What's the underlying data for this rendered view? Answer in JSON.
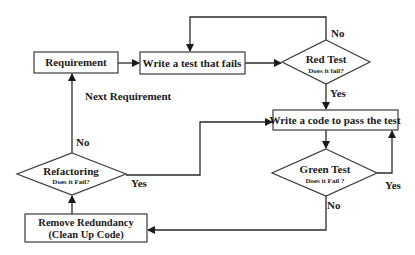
{
  "diagram": {
    "type": "flowchart",
    "nodes": {
      "requirement": {
        "label": "Requirement",
        "shape": "rectangle"
      },
      "write_test": {
        "label": "Write a test that fails",
        "shape": "rectangle"
      },
      "red_test": {
        "label": "Red Test",
        "sublabel": "Does it fail?",
        "shape": "diamond"
      },
      "write_code": {
        "label": "Write a code to pass the test",
        "shape": "rectangle"
      },
      "green_test": {
        "label": "Green Test",
        "sublabel": "Does it Fail ?",
        "shape": "diamond"
      },
      "remove_redundancy": {
        "label": "Remove Redundancy",
        "label2": "(Clean Up Code)",
        "shape": "rectangle"
      },
      "refactoring": {
        "label": "Refactoring",
        "sublabel": "Does it Fail?",
        "shape": "diamond"
      }
    },
    "edges": {
      "req_to_test": {
        "from": "requirement",
        "to": "write_test",
        "label": ""
      },
      "test_to_red": {
        "from": "write_test",
        "to": "red_test",
        "label": ""
      },
      "red_no": {
        "from": "red_test",
        "to": "write_test",
        "label": "No"
      },
      "red_yes": {
        "from": "red_test",
        "to": "write_code",
        "label": "Yes"
      },
      "code_to_green": {
        "from": "write_code",
        "to": "green_test",
        "label": ""
      },
      "green_yes": {
        "from": "green_test",
        "to": "write_code",
        "label": "Yes"
      },
      "green_no": {
        "from": "green_test",
        "to": "remove_redundancy",
        "label": "No"
      },
      "remove_to_refactor": {
        "from": "remove_redundancy",
        "to": "refactoring",
        "label": ""
      },
      "refactor_yes": {
        "from": "refactoring",
        "to": "write_code",
        "label": "Yes"
      },
      "refactor_no": {
        "from": "refactoring",
        "to": "requirement",
        "label": "No"
      }
    },
    "annotations": {
      "next_requirement": "Next Requirement"
    }
  }
}
